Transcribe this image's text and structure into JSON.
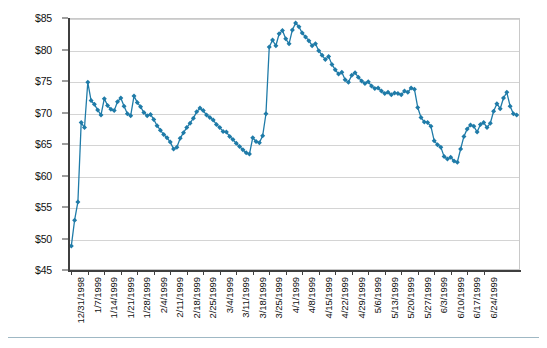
{
  "chart_data": {
    "type": "line",
    "title": "",
    "subtitle": "",
    "xlabel": "",
    "ylabel": "",
    "ylim": [
      45,
      85
    ],
    "ytick_step": 5,
    "ytick_labels": [
      "$45",
      "$50",
      "$55",
      "$60",
      "$65",
      "$70",
      "$75",
      "$80",
      "$85"
    ],
    "ytick_values": [
      45,
      50,
      55,
      60,
      65,
      70,
      75,
      80,
      85
    ],
    "grid": true,
    "grid_axis": "y",
    "legend": false,
    "legend_position": "none",
    "marker": "diamond",
    "series_color": "#1f7ba8",
    "grid_color": "#d4d4d4",
    "axis_color": "#3f3f3f",
    "plot_background": "#ffffff",
    "xtick_labels": [
      "12/31/1998",
      "1/7/1999",
      "1/14/1999",
      "1/21/1999",
      "1/28/1999",
      "2/4/1999",
      "2/11/1999",
      "2/18/1999",
      "2/25/1999",
      "3/4/1999",
      "3/11/1999",
      "3/18/1999",
      "3/25/1999",
      "4/1/1999",
      "4/8/1999",
      "4/15/1999",
      "4/22/1999",
      "4/29/1999",
      "5/6/1999",
      "5/13/1999",
      "5/20/1999",
      "5/27/1999",
      "6/3/1999",
      "6/10/1999",
      "6/17/1999",
      "6/24/1999"
    ],
    "xtick_interval_days": 5,
    "x_start": "12/31/1998",
    "x_end": "6/24/1999",
    "values": [
      48.8,
      52.9,
      55.8,
      68.4,
      67.6,
      74.8,
      71.9,
      71.3,
      70.4,
      69.6,
      72.2,
      71.1,
      70.5,
      70.3,
      71.7,
      72.3,
      71.0,
      69.8,
      69.5,
      72.6,
      71.6,
      70.9,
      70.0,
      69.5,
      69.7,
      68.9,
      67.9,
      67.2,
      66.5,
      66.0,
      65.3,
      64.2,
      64.5,
      65.9,
      66.8,
      67.6,
      68.3,
      69.1,
      70.1,
      70.7,
      70.3,
      69.6,
      69.2,
      68.8,
      68.1,
      67.6,
      67.0,
      66.9,
      66.2,
      65.7,
      65.1,
      64.6,
      64.1,
      63.6,
      63.4,
      66.0,
      65.4,
      65.2,
      66.3,
      69.8,
      80.4,
      81.5,
      80.6,
      82.5,
      83.0,
      81.7,
      80.9,
      83.1,
      84.2,
      83.6,
      82.6,
      82.0,
      81.4,
      80.6,
      80.9,
      79.8,
      79.1,
      78.4,
      78.9,
      77.6,
      76.8,
      76.1,
      76.4,
      75.2,
      74.8,
      75.9,
      76.3,
      75.6,
      75.0,
      74.6,
      74.9,
      74.2,
      73.8,
      73.9,
      73.4,
      73.0,
      73.2,
      72.8,
      73.1,
      73.0,
      72.8,
      73.4,
      73.2,
      73.9,
      73.7,
      70.8,
      69.2,
      68.5,
      68.4,
      67.8,
      65.5,
      64.9,
      64.5,
      63.0,
      62.6,
      62.9,
      62.3,
      62.1,
      64.2,
      66.2,
      67.4,
      68.0,
      67.8,
      66.9,
      68.1,
      68.4,
      67.6,
      68.3,
      70.2,
      71.4,
      70.6,
      72.3,
      73.2,
      71.0,
      69.8,
      69.6
    ]
  }
}
